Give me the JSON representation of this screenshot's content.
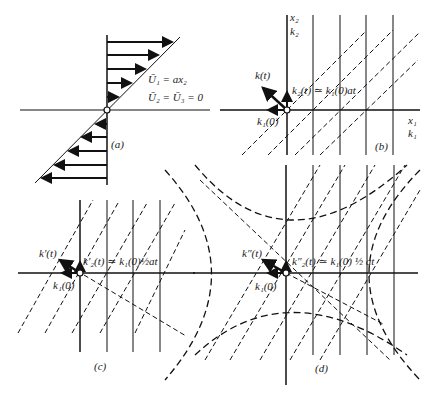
{
  "figure": {
    "panels": [
      {
        "id": "a",
        "caption": "(a)",
        "equations": [
          "Ū₁ = ax₂",
          "Ū₂ = Ū₃ = 0"
        ]
      },
      {
        "id": "b",
        "caption": "(b)",
        "axis_vertical": [
          "x₂",
          "k₂"
        ],
        "axis_horizontal": [
          "x₁",
          "k₁"
        ],
        "vector_label": "k(t)",
        "k2_label": "k₂(t) ≃ k₁(0)at",
        "k1_label": "k₁(0)"
      },
      {
        "id": "c",
        "caption": "(c)",
        "vector_label": "k′(t)",
        "k2_label": "k′₂(t) ≃ k₁(0)½at",
        "k1_label": "k₁(0)"
      },
      {
        "id": "d",
        "caption": "(d)",
        "vector_label": "k″(t)",
        "k2_label": "k″₂(t) ≃ k₁(0) ½ at",
        "k1_label": "k₁(0)"
      }
    ]
  }
}
